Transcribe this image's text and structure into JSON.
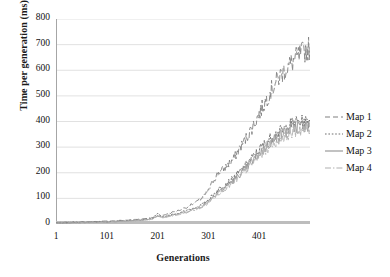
{
  "chart_data": {
    "type": "line",
    "title": "",
    "xlabel": "Generations",
    "ylabel": "Time per generation (ms)",
    "xlim": [
      1,
      501
    ],
    "ylim": [
      0,
      800
    ],
    "grid": true,
    "legend_position": "right",
    "xticks": [
      "1",
      "101",
      "201",
      "301",
      "401"
    ],
    "xtick_values": [
      1,
      101,
      201,
      301,
      401
    ],
    "yticks": [
      "0",
      "100",
      "200",
      "300",
      "400",
      "500",
      "600",
      "700",
      "800"
    ],
    "ytick_values": [
      0,
      100,
      200,
      300,
      400,
      500,
      600,
      700,
      800
    ],
    "x": [
      1,
      21,
      41,
      61,
      81,
      101,
      121,
      141,
      161,
      181,
      191,
      201,
      211,
      221,
      241,
      261,
      281,
      291,
      301,
      311,
      321,
      331,
      341,
      351,
      361,
      371,
      381,
      391,
      401,
      411,
      421,
      431,
      441,
      451,
      461,
      471,
      481,
      491,
      501
    ],
    "series": [
      {
        "name": "Map 1",
        "style": "dashed",
        "color": "#808080",
        "values": [
          4,
          6,
          7,
          8,
          9,
          11,
          13,
          15,
          18,
          22,
          25,
          30,
          34,
          40,
          52,
          68,
          90,
          105,
          130,
          170,
          200,
          215,
          235,
          255,
          290,
          320,
          355,
          390,
          430,
          470,
          510,
          545,
          575,
          600,
          620,
          640,
          660,
          675,
          690
        ]
      },
      {
        "name": "Map 2",
        "style": "dotted",
        "color": "#6e6e6e",
        "values": [
          3,
          5,
          6,
          7,
          8,
          9,
          11,
          13,
          15,
          19,
          22,
          40,
          28,
          32,
          42,
          55,
          68,
          78,
          95,
          115,
          135,
          150,
          165,
          180,
          200,
          220,
          245,
          265,
          290,
          310,
          330,
          345,
          358,
          370,
          385,
          395,
          400,
          395,
          400
        ]
      },
      {
        "name": "Map 3",
        "style": "solid",
        "color": "#9a9a9a",
        "values": [
          3,
          4,
          5,
          6,
          7,
          8,
          10,
          12,
          14,
          17,
          20,
          34,
          26,
          30,
          39,
          50,
          63,
          72,
          88,
          108,
          126,
          140,
          155,
          170,
          190,
          210,
          232,
          252,
          275,
          295,
          315,
          332,
          345,
          356,
          368,
          378,
          385,
          380,
          382
        ]
      },
      {
        "name": "Map 4",
        "style": "dashdot",
        "color": "#b0b0b0",
        "values": [
          3,
          4,
          5,
          6,
          6,
          8,
          9,
          11,
          13,
          16,
          19,
          30,
          25,
          28,
          36,
          47,
          59,
          68,
          83,
          102,
          120,
          134,
          148,
          162,
          182,
          202,
          223,
          243,
          264,
          284,
          303,
          320,
          333,
          344,
          355,
          364,
          370,
          366,
          368
        ]
      }
    ],
    "baseline_series": {
      "name": "zero-baseline",
      "color": "#bdbdbd",
      "value": 0
    }
  },
  "legend": {
    "entries": [
      {
        "label": "Map 1"
      },
      {
        "label": "Map 2"
      },
      {
        "label": "Map 3"
      },
      {
        "label": "Map 4"
      }
    ]
  },
  "colors": {
    "gridline": "#d9d9d9",
    "axis": "#a6a6a6",
    "text": "#111111"
  }
}
